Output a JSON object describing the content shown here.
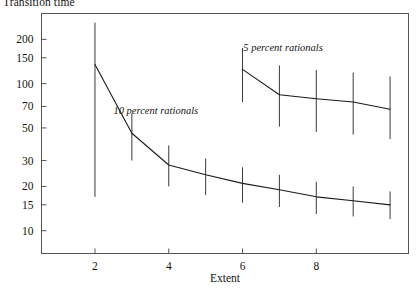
{
  "chart_data": {
    "type": "line",
    "title": "Transition time",
    "xlabel": "Extent",
    "ylabel": "",
    "xlim": [
      0.55,
      10.5
    ],
    "ylim": [
      7.0,
      300.0
    ],
    "yscale": "log",
    "xscale": "linear",
    "grid": false,
    "legend": "annotations-inline",
    "xticks": [
      2,
      4,
      6,
      8
    ],
    "xtick_labels": [
      "2",
      "4",
      "6",
      "8"
    ],
    "yticks": [
      200,
      150,
      100,
      70,
      50,
      30,
      20,
      15,
      10
    ],
    "ytick_labels": [
      "200",
      "150",
      "100",
      "70",
      "50",
      "30",
      "20",
      "15",
      "10"
    ],
    "series": [
      {
        "name": "10 percent rationals",
        "annotation": "10 percent rationals",
        "annotation_x": 3.65,
        "annotation_y": 62,
        "x": [
          2,
          3,
          4,
          5,
          6,
          7,
          8,
          9,
          10
        ],
        "values": [
          135,
          46,
          28,
          24,
          21,
          19,
          17,
          16,
          15
        ],
        "err_low": [
          17,
          30,
          20,
          17.5,
          15.5,
          14.5,
          13,
          12.5,
          12
        ],
        "err_high": [
          260,
          63,
          38,
          31,
          27,
          24,
          21.5,
          20,
          18.5
        ]
      },
      {
        "name": "5 percent rationals",
        "annotation": "5 percent rationals",
        "annotation_x": 7.1,
        "annotation_y": 168,
        "x": [
          6,
          7,
          8,
          9,
          10
        ],
        "values": [
          125,
          84,
          79,
          75,
          67
        ],
        "err_low": [
          75,
          51,
          47,
          45,
          42
        ],
        "err_high": [
          175,
          133,
          124,
          119,
          112
        ]
      }
    ]
  },
  "chart_style": {
    "frame_color": "#555555",
    "line_color": "#1a1a1a",
    "errorbar_color": "#3a3a3a",
    "text_color": "#141414",
    "background": "#ffffff"
  }
}
